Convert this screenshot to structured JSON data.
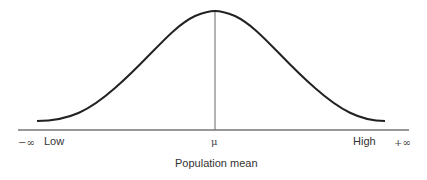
{
  "diagram": {
    "type": "normal-distribution-curve",
    "axis": {
      "left_symbol": "−∞",
      "right_symbol": "+∞",
      "low_label": "Low",
      "high_label": "High",
      "center_symbol": "μ",
      "caption": "Population mean"
    },
    "colors": {
      "curve": "#222222",
      "axis": "#333333",
      "mean_line": "#555555",
      "text": "#333333"
    }
  }
}
